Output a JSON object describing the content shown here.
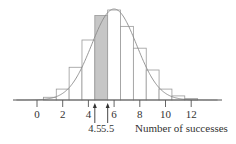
{
  "chart_data": {
    "type": "bar",
    "subtype": "histogram-with-normal-curve",
    "title": "",
    "xlabel": "Number of successes",
    "ylabel": "",
    "categories": [
      1,
      2,
      3,
      4,
      5,
      6,
      7,
      8,
      9,
      10,
      11,
      12
    ],
    "values": [
      0.01,
      0.04,
      0.12,
      0.22,
      0.31,
      0.33,
      0.27,
      0.19,
      0.11,
      0.04,
      0.015,
      0.005
    ],
    "shaded_category": 5,
    "shaded_range": [
      4.5,
      5.5
    ],
    "normal_curve": {
      "mean": 6,
      "sd": 1.75
    },
    "xlim": [
      -1.9,
      14.3
    ],
    "xticks": [
      0,
      2,
      4,
      6,
      8,
      10,
      12
    ],
    "xtick_labels": [
      "0",
      "2",
      "4",
      "6",
      "8",
      "10",
      "12"
    ],
    "annotations": [
      {
        "x": 4.5,
        "label": "4.5",
        "marker": "up-arrow"
      },
      {
        "x": 5.5,
        "label": "5.5",
        "marker": "up-arrow"
      }
    ],
    "grid": false,
    "legend": null
  },
  "colors": {
    "bar_fill": "#ffffff",
    "bar_stroke": "#9a9a9a",
    "shaded_fill": "#c6c6c6",
    "curve": "#8a8a8a",
    "axis": "#555555",
    "text": "#333333"
  }
}
